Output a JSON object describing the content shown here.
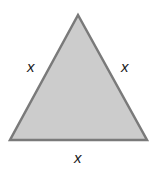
{
  "diagram": {
    "shape": "equilateral-triangle",
    "fill_color": "#cccccc",
    "stroke_color": "#7a7a7a",
    "vertices": [
      [
        78,
        15
      ],
      [
        10,
        140
      ],
      [
        147,
        140
      ]
    ],
    "labels": {
      "left_side": "x",
      "right_side": "x",
      "base": "x"
    }
  }
}
